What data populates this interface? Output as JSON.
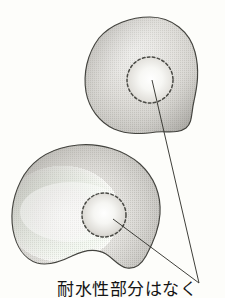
{
  "figure": {
    "title": "",
    "background_color": "#fdfdfa",
    "ink_color": "#2a2a2a",
    "shade_light": "#fbfbf8",
    "shade_mid": "#c8c7c2",
    "shade_dark": "#8e8d88",
    "outline_color": "#3a3a38",
    "caption": "耐水性部分はなく",
    "caption_note": "caption text clipped by bottom edge of image",
    "shapes": [
      {
        "name": "upper-blob",
        "kind": "amoeba-outline",
        "bounds": {
          "x": 85,
          "y": 17,
          "width": 113,
          "height": 118
        },
        "fill": "halftone-gradient",
        "inner_marker": {
          "name": "upper-dashed-circle",
          "cx": 150,
          "cy": 80,
          "r": 24,
          "stroke": "dashed",
          "fill": "light"
        }
      },
      {
        "name": "lower-blob",
        "kind": "kidney-outline",
        "bounds": {
          "x": 11,
          "y": 144,
          "width": 150,
          "height": 125
        },
        "fill": "halftone-gradient",
        "inner_marker": {
          "name": "lower-dashed-circle",
          "cx": 104,
          "cy": 215,
          "r": 23,
          "stroke": "dashed",
          "fill": "light"
        }
      }
    ],
    "leader_lines": [
      {
        "name": "leader-line-upper",
        "from": {
          "x": 152,
          "y": 80
        },
        "to": {
          "x": 199,
          "y": 283
        }
      },
      {
        "name": "leader-line-lower",
        "from": {
          "x": 112,
          "y": 218
        },
        "to": {
          "x": 199,
          "y": 283
        }
      }
    ],
    "convergence_point": {
      "x": 199,
      "y": 283
    }
  }
}
